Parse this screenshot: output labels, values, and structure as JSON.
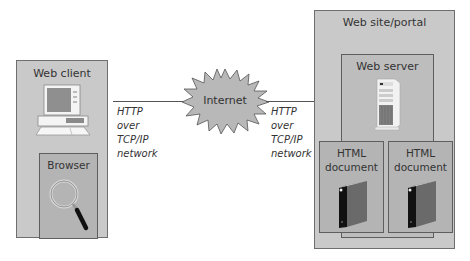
{
  "diagram": {
    "client": {
      "title": "Web client",
      "computer_icon": "desktop-computer-icon",
      "browser": {
        "title": "Browser",
        "icon": "magnifying-glass-icon"
      }
    },
    "left_link": {
      "lines": [
        "HTTP",
        "over",
        "TCP/IP",
        "network"
      ]
    },
    "internet": {
      "label": "Internet",
      "icon": "starburst-cloud-icon"
    },
    "right_link": {
      "lines": [
        "HTTP",
        "over",
        "TCP/IP",
        "network"
      ]
    },
    "portal": {
      "title": "Web site/portal",
      "server": {
        "title": "Web server",
        "icon": "tower-server-icon"
      },
      "documents": [
        {
          "title_line1": "HTML",
          "title_line2": "document",
          "icon": "binder-icon"
        },
        {
          "title_line1": "HTML",
          "title_line2": "document",
          "icon": "binder-icon"
        }
      ]
    }
  },
  "colors": {
    "outer_box": "#c9c9c9",
    "inner_box": "#b4b4b4",
    "burst": "#b8b8b8",
    "line": "#555555"
  }
}
